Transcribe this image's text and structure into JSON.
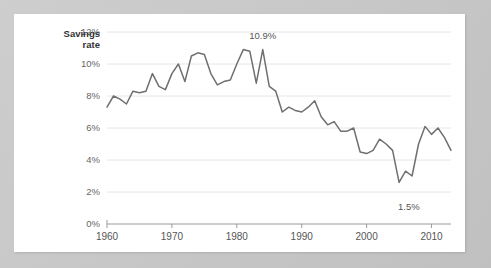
{
  "card": {
    "background_color": "#ffffff",
    "page_background_color": "#c8c8c8"
  },
  "chart_data": {
    "type": "line",
    "title": "",
    "subtitle": "",
    "xlabel": "",
    "ylabel": "Savings rate",
    "ylabel_line1": "Savings",
    "ylabel_line2": "rate",
    "ylim": [
      0,
      12
    ],
    "xlim": [
      1960,
      2013
    ],
    "grid": true,
    "legend_position": "none",
    "line_color": "#6f6f6f",
    "gridline_color": "#e6e6e6",
    "axis_color": "#9a9a9a",
    "y_ticks": [
      0,
      2,
      4,
      6,
      8,
      10,
      12
    ],
    "y_tick_labels": [
      "0%",
      "2%",
      "4%",
      "6%",
      "8%",
      "10%",
      "12%"
    ],
    "x_ticks": [
      1960,
      1970,
      1980,
      1990,
      2000,
      2010
    ],
    "x_tick_labels": [
      "1960",
      "1970",
      "1980",
      "1990",
      "2000",
      "2010"
    ],
    "annotations": [
      {
        "text": "10.9%",
        "x": 1984.0,
        "y": 11.55,
        "anchor": "middle"
      },
      {
        "text": "1.5%",
        "x": 2006.5,
        "y": 0.85,
        "anchor": "middle"
      }
    ],
    "x": [
      1960,
      1961,
      1962,
      1963,
      1964,
      1965,
      1966,
      1967,
      1968,
      1969,
      1970,
      1971,
      1972,
      1973,
      1974,
      1975,
      1976,
      1977,
      1978,
      1979,
      1980,
      1981,
      1982,
      1983,
      1984,
      1985,
      1986,
      1987,
      1988,
      1989,
      1990,
      1991,
      1992,
      1993,
      1994,
      1995,
      1996,
      1997,
      1998,
      1999,
      2000,
      2001,
      2002,
      2003,
      2004,
      2005,
      2006,
      2007,
      2008,
      2009,
      2010,
      2011,
      2012,
      2013
    ],
    "values": [
      7.3,
      8.0,
      7.8,
      7.5,
      8.3,
      8.2,
      8.3,
      9.4,
      8.6,
      8.4,
      9.4,
      10.0,
      8.9,
      10.5,
      10.7,
      10.6,
      9.4,
      8.7,
      8.9,
      9.0,
      10.0,
      10.9,
      10.8,
      8.8,
      10.9,
      8.6,
      8.3,
      7.0,
      7.3,
      7.1,
      7.0,
      7.3,
      7.7,
      6.7,
      6.2,
      6.4,
      5.8,
      5.8,
      6.0,
      4.5,
      4.4,
      4.6,
      5.3,
      5.0,
      4.6,
      2.6,
      3.3,
      3.0,
      5.0,
      6.1,
      5.6,
      6.0,
      5.4,
      4.6
    ]
  }
}
